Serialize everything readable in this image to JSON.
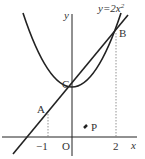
{
  "diagram": {
    "curve_label": "y=2x",
    "curve_exponent": "2",
    "axis_x_label": "x",
    "axis_y_label": "y",
    "origin_label": "O",
    "points": {
      "A": {
        "label": "A",
        "x": -1,
        "y": 2
      },
      "B": {
        "label": "B",
        "x": 2,
        "y": 8
      },
      "C": {
        "label": "C",
        "x": 0,
        "y": 4
      },
      "P": {
        "label": "P"
      }
    },
    "ticks": {
      "neg_one": "−1",
      "two": "2"
    },
    "colors": {
      "stroke": "#222222",
      "dotted": "#666666"
    }
  }
}
